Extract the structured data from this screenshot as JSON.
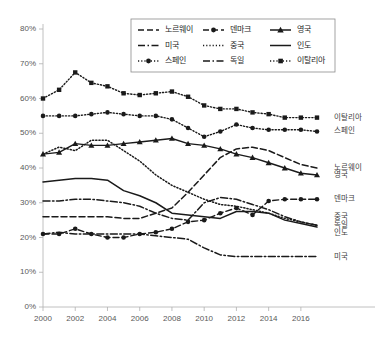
{
  "chart_data": {
    "type": "line",
    "title": "",
    "xlabel": "",
    "ylabel": "",
    "xlim": [
      2000,
      2017
    ],
    "ylim": [
      0,
      0.8
    ],
    "y_tick_labels": [
      "0%",
      "10%",
      "20%",
      "30%",
      "40%",
      "50%",
      "60%",
      "70%",
      "80%"
    ],
    "y_tick_values": [
      0,
      10,
      20,
      30,
      40,
      50,
      60,
      70,
      80
    ],
    "x_tick_labels": [
      "2000",
      "2002",
      "2004",
      "2006",
      "2008",
      "2010",
      "2012",
      "2014",
      "2016"
    ],
    "x_tick_values": [
      2000,
      2002,
      2004,
      2006,
      2008,
      2010,
      2012,
      2014,
      2016
    ],
    "x": [
      2000,
      2001,
      2002,
      2003,
      2004,
      2005,
      2006,
      2007,
      2008,
      2009,
      2010,
      2011,
      2012,
      2013,
      2014,
      2015,
      2016,
      2017
    ],
    "grid": false,
    "legend_position": "top-center",
    "series": [
      {
        "name": "노르웨이",
        "style": "dashed",
        "marker": "none",
        "end_label": "노르웨이",
        "values": [
          26,
          26,
          26,
          26,
          26,
          25.5,
          25.5,
          27,
          28.5,
          33,
          38,
          43,
          45.5,
          46,
          45,
          43,
          41,
          40
        ]
      },
      {
        "name": "덴마크",
        "style": "dashed",
        "marker": "circle",
        "end_label": "덴마크",
        "values": [
          21,
          21,
          22.5,
          21,
          20,
          20,
          21,
          21.5,
          22.5,
          24.5,
          25,
          27,
          28.5,
          26.5,
          30.5,
          31,
          31,
          31
        ]
      },
      {
        "name": "영국",
        "style": "solid",
        "marker": "triangle",
        "end_label": "영국",
        "values": [
          44,
          44.5,
          47,
          46.5,
          46.5,
          47,
          47.5,
          48,
          48.5,
          47,
          46.5,
          45.5,
          44,
          43,
          41.5,
          40,
          38.5,
          38
        ]
      },
      {
        "name": "미국",
        "style": "dashdot",
        "marker": "none",
        "end_label": "미국",
        "values": [
          21,
          21.5,
          21,
          21,
          21,
          21,
          21,
          20.5,
          20,
          19.5,
          17,
          15,
          14.5,
          14.5,
          14.5,
          14.5,
          14.5,
          14.5
        ]
      },
      {
        "name": "중국",
        "style": "dotted",
        "marker": "none",
        "end_label": "중국",
        "values": [
          44,
          46,
          45,
          48,
          48,
          45,
          42,
          38,
          35,
          33,
          31,
          29.5,
          29,
          28,
          27,
          25.5,
          24.5,
          23.5
        ]
      },
      {
        "name": "인도",
        "style": "solid",
        "marker": "none",
        "end_label": "인도",
        "values": [
          36,
          36.5,
          37,
          37,
          36.5,
          33.5,
          32,
          30,
          27,
          26.5,
          26,
          25.5,
          27.5,
          27.5,
          27,
          25,
          24,
          23
        ]
      },
      {
        "name": "스페인",
        "style": "dotted",
        "marker": "circle",
        "end_label": "스페인",
        "values": [
          55,
          55,
          55,
          55.5,
          56,
          55.5,
          55,
          55,
          54,
          51.5,
          49,
          50.5,
          52.5,
          51.5,
          51,
          51,
          51,
          50.5
        ]
      },
      {
        "name": "독일",
        "style": "dashdot",
        "marker": "none",
        "end_label": "독일",
        "values": [
          30.5,
          30.5,
          31,
          31,
          30.5,
          30,
          29,
          27,
          25.5,
          25,
          30,
          31.5,
          31,
          29.5,
          28,
          26,
          24.5,
          23.5
        ]
      },
      {
        "name": "이탈리아",
        "style": "dotted",
        "marker": "square",
        "end_label": "이탈리아",
        "values": [
          60,
          62.5,
          67.5,
          64.5,
          63.5,
          61.5,
          61,
          61.5,
          62,
          60.5,
          58,
          57,
          57,
          56,
          55.5,
          54.5,
          54.5,
          54.5
        ]
      }
    ]
  },
  "legend": {
    "items": [
      {
        "label": "노르웨이",
        "style": "dashed",
        "marker": "none"
      },
      {
        "label": "덴마크",
        "style": "dashed",
        "marker": "circle"
      },
      {
        "label": "영국",
        "style": "solid",
        "marker": "triangle"
      },
      {
        "label": "미국",
        "style": "dashdot",
        "marker": "none"
      },
      {
        "label": "중국",
        "style": "dotted",
        "marker": "none"
      },
      {
        "label": "인도",
        "style": "solid",
        "marker": "none"
      },
      {
        "label": "스페인",
        "style": "dotted",
        "marker": "circle"
      },
      {
        "label": "독일",
        "style": "dashdot",
        "marker": "none"
      },
      {
        "label": "이탈리아",
        "style": "dotted",
        "marker": "square"
      }
    ]
  },
  "end_labels": [
    {
      "label": "이탈리아",
      "y_value": 54.5
    },
    {
      "label": "스페인",
      "y_value": 50.5
    },
    {
      "label": "노르웨이",
      "y_value": 40
    },
    {
      "label": "영국",
      "y_value": 38
    },
    {
      "label": "덴마크",
      "y_value": 31
    },
    {
      "label": "중국",
      "y_value": 25.8
    },
    {
      "label": "독일",
      "y_value": 23.5
    },
    {
      "label": "인도",
      "y_value": 21.2
    },
    {
      "label": "미국",
      "y_value": 14.5
    }
  ],
  "colors": {
    "line": "#1a1a1a",
    "axis": "#b0b0b0",
    "tick_text": "#595959",
    "end_label_text": "#404040",
    "legend_border": "#8c8c8c",
    "background": "#ffffff"
  }
}
